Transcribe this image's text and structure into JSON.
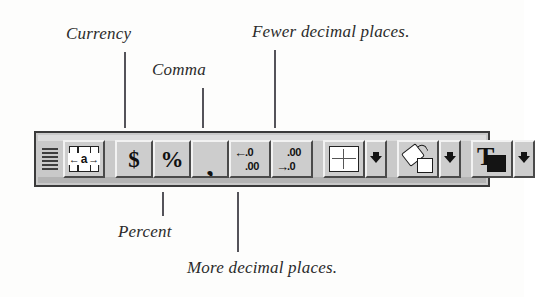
{
  "figure": {
    "kind": "annotated-screenshot"
  },
  "callouts": [
    {
      "id": "currency",
      "label": "Currency",
      "points_to": "currency-format-button"
    },
    {
      "id": "comma",
      "label": "Comma",
      "points_to": "comma-format-button"
    },
    {
      "id": "fewer",
      "label": "Fewer decimal places.",
      "points_to": "decrease-decimal-button"
    },
    {
      "id": "percent",
      "label": "Percent",
      "points_to": "percent-format-button"
    },
    {
      "id": "more",
      "label": "More decimal places.",
      "points_to": "increase-decimal-button"
    }
  ],
  "toolbar": {
    "name": "Formatting toolbar",
    "grip": {
      "icon": "drag-grip-icon",
      "lines": 6
    },
    "groups": [
      {
        "id": "alignment",
        "buttons": [
          {
            "id": "center-across-selection",
            "icon": "center-across-selection-icon",
            "glyph_text": "a",
            "left_arrow": "←",
            "right_arrow": "→",
            "has_dropdown": false
          }
        ]
      },
      {
        "id": "number-format",
        "buttons": [
          {
            "id": "currency-format-button",
            "icon": "dollar-sign-icon",
            "glyph_text": "$",
            "has_dropdown": false
          },
          {
            "id": "percent-format-button",
            "icon": "percent-sign-icon",
            "glyph_text": "%",
            "has_dropdown": false
          },
          {
            "id": "comma-format-button",
            "icon": "comma-icon",
            "glyph_text": ",",
            "has_dropdown": false
          },
          {
            "id": "increase-decimal-button",
            "icon": "increase-decimal-icon",
            "arrow": "←",
            "top_text": ".0",
            "bottom_text": ".00",
            "has_dropdown": false
          },
          {
            "id": "decrease-decimal-button",
            "icon": "decrease-decimal-icon",
            "arrow": "→",
            "top_text": ".00",
            "bottom_text": ".0",
            "has_dropdown": false
          }
        ]
      },
      {
        "id": "borders",
        "buttons": [
          {
            "id": "borders-button",
            "icon": "borders-grid-icon",
            "has_dropdown": true,
            "dropdown_icon": "dropdown-arrow-icon"
          }
        ]
      },
      {
        "id": "fill-color",
        "buttons": [
          {
            "id": "fill-color-button",
            "icon": "paint-bucket-icon",
            "has_dropdown": true,
            "dropdown_icon": "dropdown-arrow-icon"
          }
        ]
      },
      {
        "id": "font-color",
        "buttons": [
          {
            "id": "font-color-button",
            "icon": "font-color-icon",
            "glyph_text": "T",
            "has_dropdown": true,
            "dropdown_icon": "dropdown-arrow-icon"
          }
        ]
      }
    ]
  },
  "colors": {
    "page_background": "#fdfdfc",
    "toolbar_face": "#c9c9c9",
    "button_face": "#cdcdcd",
    "button_highlight": "#f2f2f2",
    "button_shadow": "#4a4a4a",
    "frame_border": "#3a3a3a",
    "ink": "#111111",
    "label_text": "#2b2b2b",
    "leader_line": "#54535a"
  }
}
